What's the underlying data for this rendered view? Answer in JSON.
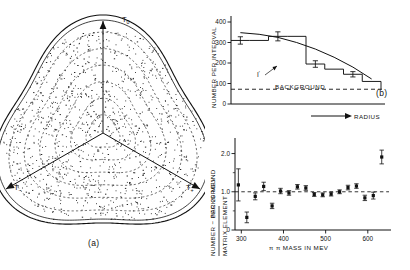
{
  "figure": {
    "panels": [
      {
        "tag": "(a)",
        "kind": "dalitz-plot"
      },
      {
        "tag": "(b)",
        "kind": "histogram"
      },
      {
        "tag": "(c)",
        "kind": "scatter"
      }
    ]
  },
  "panel_a": {
    "tag": "(a)",
    "axis_top_label": "T",
    "axis_top_sub": "0",
    "axis_left_label": "T",
    "axis_left_sub": "−",
    "axis_right_label": "T",
    "axis_right_sub": "+",
    "boundary_style": "solid",
    "contour_style": "dashed",
    "contour_count": 6,
    "point_count": 1150
  },
  "chart_data": [
    {
      "type": "scatter",
      "panel": "(a)",
      "title": "",
      "xlabel": "T−",
      "ylabel": "T0",
      "description": "Dalitz plot: triangular rounded boundary with six dashed concentric radius contours and three radial axes at 90, 210, 330 degrees",
      "grid": true,
      "legend": "none"
    },
    {
      "type": "bar",
      "panel": "(b)",
      "title": "",
      "xlabel": "RADIUS",
      "ylabel": "NUMBER PER INTERVAL",
      "ylim": [
        0,
        400
      ],
      "yticks": [
        0,
        100,
        200,
        300,
        400
      ],
      "xticks": [],
      "grid": false,
      "legend": "none",
      "categories": [
        "1",
        "2",
        "3",
        "4",
        "5",
        "6",
        "7",
        "8"
      ],
      "values": [
        310,
        310,
        330,
        330,
        195,
        170,
        145,
        110
      ],
      "errors": [
        18,
        18,
        22,
        22,
        16,
        14,
        13,
        12
      ],
      "curve_label": "I",
      "curve_label_sup": "′",
      "curve_values": [
        348,
        340,
        325,
        300,
        268,
        228,
        180,
        122
      ],
      "background_label": "BACKGROUND",
      "background_value": 72
    },
    {
      "type": "scatter",
      "panel": "(c)",
      "title": "",
      "xlabel": "π π MASS IN MEV",
      "ylabel": "NUMBER − BACKGROUND / MATRIX ELEMENT",
      "ylabel_units": "PER 20 MEV",
      "ylim": [
        0,
        2.25
      ],
      "yticks": [
        0,
        1.0,
        2.0
      ],
      "ytick_labels": [
        "0",
        "1.0",
        "2.0"
      ],
      "xlim": [
        285,
        655
      ],
      "xticks": [
        300,
        400,
        500,
        600
      ],
      "xtick_labels": [
        "300",
        "400",
        "500",
        "600"
      ],
      "reference_line": 1.0,
      "reference_style": "dashed",
      "grid": false,
      "legend": "none",
      "x": [
        293,
        313,
        333,
        353,
        373,
        393,
        413,
        433,
        453,
        473,
        493,
        513,
        533,
        553,
        573,
        593,
        613,
        633
      ],
      "values": [
        1.18,
        0.33,
        0.88,
        1.14,
        0.63,
        1.02,
        0.97,
        1.13,
        1.1,
        0.93,
        0.92,
        0.94,
        1.0,
        1.11,
        1.15,
        0.84,
        0.9,
        1.91,
        0.83
      ],
      "errors": [
        0.42,
        0.14,
        0.09,
        0.11,
        0.07,
        0.07,
        0.06,
        0.06,
        0.06,
        0.05,
        0.05,
        0.05,
        0.05,
        0.06,
        0.06,
        0.07,
        0.09,
        0.18,
        0.65
      ]
    }
  ],
  "panel_b": {
    "tag": "(b)",
    "ylabel": "NUMBER PER INTERVAL",
    "xlabel": "RADIUS",
    "ytick_labels": [
      "0",
      "100",
      "200",
      "300",
      "400"
    ],
    "background_label": "BACKGROUND",
    "curve_label": "I",
    "curve_label_sup": "′"
  },
  "panel_c": {
    "tag": "(c)",
    "ylabel_numerator": "NUMBER − BACKGROUND",
    "ylabel_denominator": "MATRIX ELEMENT",
    "ylabel_units": "PER 20 MEV",
    "xlabel": "π π MASS IN MEV",
    "ytick_labels": [
      "0",
      "1.0",
      "2.0"
    ],
    "xtick_labels": [
      "300",
      "400",
      "500",
      "600"
    ]
  }
}
